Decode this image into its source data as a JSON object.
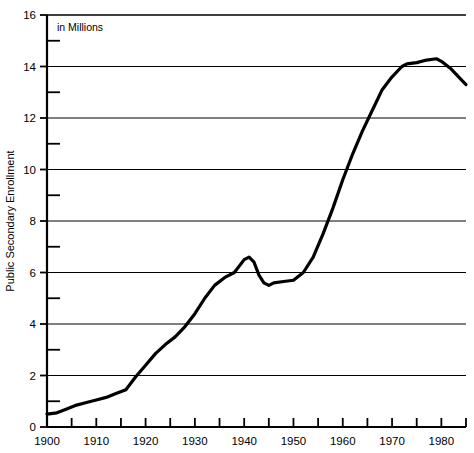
{
  "chart_data": {
    "type": "line",
    "title": "",
    "subtitle": "",
    "annotation": "in Millions",
    "xlabel": "",
    "ylabel": "Public Secondary Enrollment",
    "xlim": [
      1900,
      1985
    ],
    "ylim": [
      0,
      16
    ],
    "grid": true,
    "grid_axis": "y",
    "legend": false,
    "legend_position": "none",
    "y_major_ticks": [
      0,
      2,
      4,
      6,
      8,
      10,
      12,
      14,
      16
    ],
    "y_major_tick_labels": [
      "0",
      "2",
      "4",
      "6",
      "8",
      "10",
      "12",
      "14",
      "16"
    ],
    "y_minor_ticks": [
      1,
      3,
      5,
      7,
      9,
      11,
      13,
      15
    ],
    "x_major_ticks": [
      1900,
      1910,
      1920,
      1930,
      1940,
      1950,
      1960,
      1970,
      1980
    ],
    "x_major_tick_labels": [
      "1900",
      "1910",
      "1920",
      "1930",
      "1940",
      "1950",
      "1960",
      "1970",
      "1980"
    ],
    "x_minor_ticks": [
      1905,
      1915,
      1925,
      1935,
      1945,
      1955,
      1965,
      1975,
      1985
    ],
    "units": "millions",
    "line_color": "#000000",
    "line_width": 3.2,
    "grid_color": "#000000",
    "axis_color": "#000000",
    "x": [
      1900,
      1902,
      1904,
      1906,
      1908,
      1910,
      1912,
      1914,
      1916,
      1918,
      1920,
      1922,
      1924,
      1926,
      1928,
      1930,
      1932,
      1934,
      1936,
      1938,
      1940,
      1941,
      1942,
      1943,
      1944,
      1945,
      1946,
      1948,
      1950,
      1952,
      1954,
      1956,
      1958,
      1960,
      1962,
      1964,
      1966,
      1968,
      1970,
      1972,
      1973,
      1975,
      1977,
      1979,
      1980,
      1982,
      1985
    ],
    "y": [
      0.5,
      0.55,
      0.7,
      0.85,
      0.95,
      1.05,
      1.15,
      1.3,
      1.45,
      1.95,
      2.4,
      2.85,
      3.2,
      3.5,
      3.9,
      4.4,
      5.0,
      5.5,
      5.8,
      6.0,
      6.5,
      6.6,
      6.4,
      5.9,
      5.6,
      5.5,
      5.6,
      5.65,
      5.7,
      6.0,
      6.6,
      7.5,
      8.5,
      9.6,
      10.6,
      11.5,
      12.3,
      13.1,
      13.6,
      14.0,
      14.1,
      14.15,
      14.25,
      14.3,
      14.2,
      13.9,
      13.3
    ],
    "series": [
      {
        "name": "Public Secondary Enrollment",
        "values": [
          0.5,
          0.55,
          0.7,
          0.85,
          0.95,
          1.05,
          1.15,
          1.3,
          1.45,
          1.95,
          2.4,
          2.85,
          3.2,
          3.5,
          3.9,
          4.4,
          5.0,
          5.5,
          5.8,
          6.0,
          6.5,
          6.6,
          6.4,
          5.9,
          5.6,
          5.5,
          5.6,
          5.65,
          5.7,
          6.0,
          6.6,
          7.5,
          8.5,
          9.6,
          10.6,
          11.5,
          12.3,
          13.1,
          13.6,
          14.0,
          14.1,
          14.15,
          14.25,
          14.3,
          14.2,
          13.9,
          13.3
        ]
      }
    ]
  }
}
